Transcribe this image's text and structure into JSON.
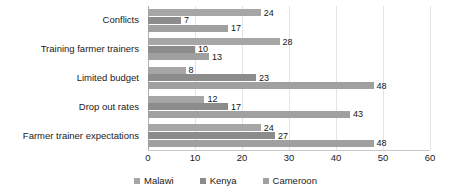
{
  "chart_data": {
    "type": "bar",
    "orientation": "horizontal",
    "title": "",
    "xlabel": "",
    "ylabel": "",
    "xlim": [
      0,
      60
    ],
    "xticks": [
      0,
      10,
      20,
      30,
      40,
      50,
      60
    ],
    "xtick_labels": [
      "0",
      "10",
      "20",
      "30",
      "40",
      "50",
      "60"
    ],
    "grid": true,
    "grid_axis": "x",
    "legend_position": "bottom",
    "categories": [
      "Conflicts",
      "Training farmer trainers",
      "Limited budget",
      "Drop out rates",
      "Farmer trainer expectations"
    ],
    "series": [
      {
        "name": "Malawi",
        "color": "#a6a6a6",
        "values": [
          24,
          28,
          8,
          12,
          24
        ]
      },
      {
        "name": "Kenya",
        "color": "#8c8c8c",
        "values": [
          7,
          10,
          23,
          17,
          27
        ]
      },
      {
        "name": "Cameroon",
        "color": "#a0a0a0",
        "values": [
          17,
          13,
          48,
          43,
          48
        ]
      }
    ],
    "data_labels": {
      "Conflicts": [
        "24",
        "7",
        "17"
      ],
      "Training farmer trainers": [
        "28",
        "10",
        "13"
      ],
      "Limited budget": [
        "8",
        "23",
        "48"
      ],
      "Drop out rates": [
        "12",
        "17",
        "43"
      ],
      "Farmer trainer expectations": [
        "24",
        "27",
        "48"
      ]
    },
    "legend": [
      {
        "label": "Malawi",
        "color": "#a6a6a6"
      },
      {
        "label": "Kenya",
        "color": "#8c8c8c"
      },
      {
        "label": "Cameroon",
        "color": "#a0a0a0"
      }
    ]
  },
  "colors": {
    "background": "#ffffff",
    "gridline": "#e4e4e4",
    "axis": "#b0b0b0",
    "text": "#1a1a1a"
  }
}
